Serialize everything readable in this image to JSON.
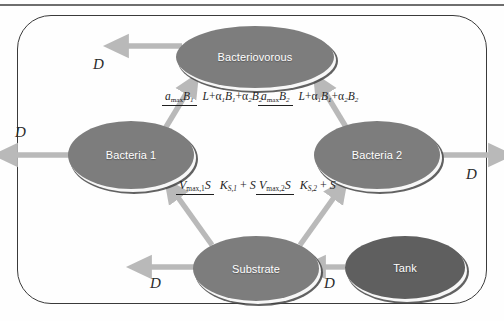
{
  "figure": {
    "frame_border_color": "#3a3a3a",
    "node_color": "#7d7d7d",
    "node_dark_color": "#5f5f5f",
    "arrow_color": "#b9b9b9",
    "text_color": "#ffffff"
  },
  "nodes": [
    {
      "id": "bacteriovorous",
      "label": "Bacteriovorous"
    },
    {
      "id": "bacteria1",
      "label": "Bacteria 1"
    },
    {
      "id": "bacteria2",
      "label": "Bacteria 2"
    },
    {
      "id": "substrate",
      "label": "Substrate"
    },
    {
      "id": "tank",
      "label": "Tank"
    }
  ],
  "dilution_labels": {
    "bacteriovorous": "D",
    "bacteria1": "D",
    "bacteria2": "D",
    "substrate": "D",
    "tank": "D"
  },
  "formulas": {
    "predation_b1": {
      "numerator_var": "a",
      "numerator_sub": "max",
      "numerator_tail": "B",
      "numerator_tail_sub": "1",
      "denominator": "L+α1B1+α2B2",
      "plain": "a_max B_1 / (L + α_1 B_1 + α_2 B_2)"
    },
    "predation_b2": {
      "numerator_var": "a",
      "numerator_sub": "max",
      "numerator_tail": "B",
      "numerator_tail_sub": "2",
      "denominator": "L+α1B1+α2B2",
      "plain": "a_max B_2 / (L + α_1 B_1 + α_2 B_2)"
    },
    "uptake_1": {
      "numerator": "V_max,1 S",
      "denominator": "K_S,1 + S",
      "plain": "V_max,1 S / (K_S,1 + S)"
    },
    "uptake_2": {
      "numerator": "V_max,2 S",
      "denominator": "K_S,2 + S",
      "plain": "V_max,2 S / (K_S,2 + S)"
    }
  },
  "symbols": {
    "V": "V",
    "K": "K",
    "S": "S",
    "L": "L",
    "B": "B",
    "a": "a",
    "alpha": "α",
    "plus": "+",
    "max": "max",
    "sub_max_1": "max,1",
    "sub_max_2": "max,2",
    "sub_S1": "S,1",
    "sub_S2": "S,2",
    "one": "1",
    "two": "2"
  }
}
